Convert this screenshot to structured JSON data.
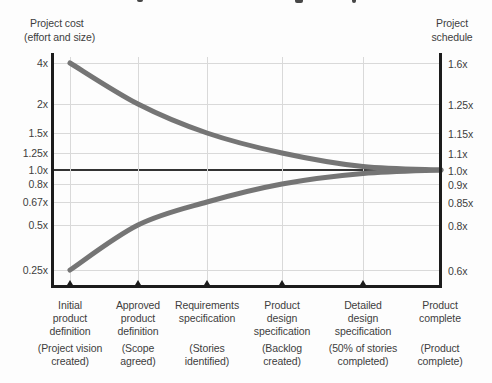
{
  "colors": {
    "background": "#fdfdfd",
    "curve": "#757575",
    "axis": "#1c1c1c",
    "gridline": "#d9d9d9",
    "baseline": "#333333",
    "text": "#3d3d3d"
  },
  "axis_titles": {
    "left_line1": "Project cost",
    "left_line2": "(effort and size)",
    "right_line1": "Project",
    "right_line2": "schedule"
  },
  "chart_data": {
    "type": "line",
    "grid": true,
    "x_categories": [
      {
        "name_lines": [
          "Initial",
          "product",
          "definition"
        ],
        "detail_lines": [
          "(Project vision",
          "created)"
        ]
      },
      {
        "name_lines": [
          "Approved",
          "product",
          "definition"
        ],
        "detail_lines": [
          "(Scope",
          "agreed)"
        ]
      },
      {
        "name_lines": [
          "Requirements",
          "specification"
        ],
        "detail_lines": [
          "(Stories",
          "identified)"
        ]
      },
      {
        "name_lines": [
          "Product",
          "design",
          "specification"
        ],
        "detail_lines": [
          "(Backlog",
          "created)"
        ]
      },
      {
        "name_lines": [
          "Detailed",
          "design",
          "specification"
        ],
        "detail_lines": [
          "(50% of stories",
          "completed)"
        ]
      },
      {
        "name_lines": [
          "Product",
          "complete"
        ],
        "detail_lines": [
          "(Product",
          "complete)"
        ]
      }
    ],
    "left_axis": {
      "title": "Project cost (effort and size)",
      "tick_labels": [
        "4x",
        "2x",
        "1.5x",
        "1.25x",
        "1.0x",
        "0.8x",
        "0.67x",
        "0.5x",
        "0.25x"
      ],
      "tick_values": [
        4,
        2,
        1.5,
        1.25,
        1.0,
        0.8,
        0.67,
        0.5,
        0.25
      ]
    },
    "right_axis": {
      "title": "Project schedule",
      "tick_labels": [
        "1.6x",
        "1.25x",
        "1.15x",
        "1.1x",
        "1.0x",
        "0.9x",
        "0.85x",
        "0.8x",
        "0.6x"
      ],
      "tick_values": [
        1.6,
        1.25,
        1.15,
        1.1,
        1.0,
        0.9,
        0.85,
        0.8,
        0.6
      ]
    },
    "series": [
      {
        "name": "upper bound (cost scale)",
        "values": [
          4,
          2,
          1.5,
          1.25,
          1.05,
          1.0
        ]
      },
      {
        "name": "lower bound (cost scale)",
        "values": [
          0.25,
          0.5,
          0.67,
          0.8,
          0.95,
          1.0
        ]
      },
      {
        "name": "upper bound (schedule scale)",
        "values": [
          1.6,
          1.25,
          1.15,
          1.1,
          1.02,
          1.0
        ]
      },
      {
        "name": "lower bound (schedule scale)",
        "values": [
          0.6,
          0.8,
          0.85,
          0.9,
          0.98,
          1.0
        ]
      }
    ],
    "baseline": {
      "cost": "1.0x",
      "schedule": "1.0x"
    }
  }
}
